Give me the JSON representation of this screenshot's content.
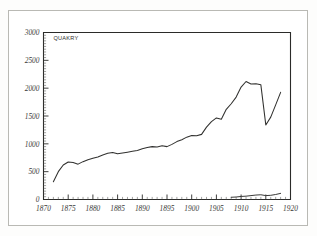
{
  "chart_data": {
    "type": "line",
    "title": "",
    "xlabel": "",
    "ylabel": "",
    "xlim": [
      1870,
      1920
    ],
    "ylim": [
      0,
      3000
    ],
    "grid": false,
    "legend_position": "inside-top-left",
    "x_ticks": [
      "1870",
      "1875",
      "1880",
      "1885",
      "1890",
      "1895",
      "1900",
      "1905",
      "1910",
      "1915",
      "1920"
    ],
    "y_ticks": [
      "0",
      "500",
      "1000",
      "1500",
      "2000",
      "2500",
      "3000"
    ],
    "x_tick_values": [
      1870,
      1875,
      1880,
      1885,
      1890,
      1895,
      1900,
      1905,
      1910,
      1915,
      1920
    ],
    "y_tick_values": [
      0,
      500,
      1000,
      1500,
      2000,
      2500,
      3000
    ],
    "x_minor_step": 1,
    "y_minor_step": 50,
    "annotations": [
      {
        "text": "QUAKRY",
        "x": 1872,
        "y": 2870
      }
    ],
    "series": [
      {
        "name": "QUAKRY",
        "x": [
          1872,
          1873,
          1874,
          1875,
          1876,
          1877,
          1878,
          1879,
          1880,
          1881,
          1882,
          1883,
          1884,
          1885,
          1886,
          1887,
          1888,
          1889,
          1890,
          1891,
          1892,
          1893,
          1894,
          1895,
          1896,
          1897,
          1898,
          1899,
          1900,
          1901,
          1902,
          1903,
          1904,
          1905,
          1906,
          1907,
          1908,
          1909,
          1910,
          1911,
          1912,
          1913,
          1914,
          1915,
          1916,
          1917,
          1918
        ],
        "values": [
          320,
          500,
          620,
          675,
          665,
          635,
          680,
          715,
          740,
          765,
          800,
          830,
          845,
          820,
          835,
          850,
          865,
          880,
          910,
          935,
          950,
          945,
          965,
          950,
          990,
          1040,
          1075,
          1120,
          1150,
          1145,
          1170,
          1300,
          1400,
          1465,
          1440,
          1620,
          1720,
          1840,
          2020,
          2120,
          2075,
          2080,
          2060,
          1340,
          1480,
          1700,
          1925
        ]
      },
      {
        "name": "secondary-low-series",
        "x": [
          1908,
          1909,
          1910,
          1911,
          1912,
          1913,
          1914,
          1915,
          1916,
          1917,
          1918
        ],
        "values": [
          40,
          45,
          55,
          60,
          70,
          80,
          85,
          70,
          75,
          90,
          110
        ]
      }
    ]
  },
  "colors": {
    "line": "#31312f",
    "axis": "#2b2b29",
    "frame": "#b9b9b4",
    "background": "#ffffff"
  }
}
